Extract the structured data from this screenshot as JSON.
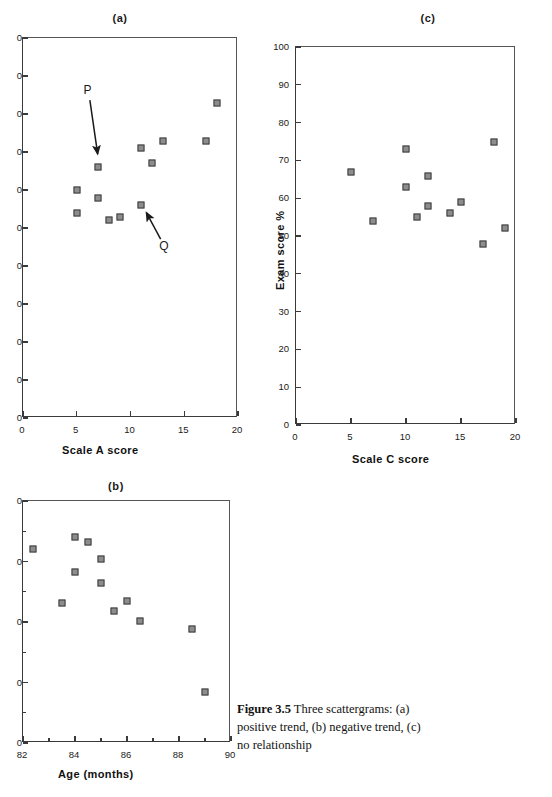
{
  "figure": {
    "caption_lead": "Figure 3.5",
    "caption_body": "Three scattergrams: (a) positive trend, (b) negative trend, (c) no relationship"
  },
  "chart_data": [
    {
      "id": "a",
      "type": "scatter",
      "title": "(a)",
      "xlabel": "Scale  A  score",
      "ylabel": "",
      "xlim": [
        0,
        20
      ],
      "ylim": [
        0,
        100
      ],
      "xticks": [
        0,
        5,
        10,
        15,
        20
      ],
      "xticklabels": [
        "0",
        "5",
        "10",
        "15",
        "20"
      ],
      "yticks": [
        0,
        10,
        20,
        30,
        40,
        50,
        60,
        70,
        80,
        90,
        100
      ],
      "yticklabels": [
        "0",
        "0",
        "0",
        "0",
        "0",
        "0",
        "0",
        "0",
        "0",
        "0",
        "0"
      ],
      "ytick_labels_clipped": true,
      "grid": false,
      "legend": "none",
      "points": [
        {
          "x": 5,
          "y": 60
        },
        {
          "x": 5,
          "y": 54
        },
        {
          "x": 7,
          "y": 66
        },
        {
          "x": 7,
          "y": 58
        },
        {
          "x": 8,
          "y": 52
        },
        {
          "x": 9,
          "y": 53
        },
        {
          "x": 11,
          "y": 56
        },
        {
          "x": 11,
          "y": 71
        },
        {
          "x": 12,
          "y": 67
        },
        {
          "x": 13,
          "y": 73
        },
        {
          "x": 17,
          "y": 73
        },
        {
          "x": 18,
          "y": 83
        }
      ],
      "annotations": [
        {
          "label": "P",
          "label_x": 6.1,
          "label_y": 86,
          "tip_x": 7.0,
          "tip_y": 68.4
        },
        {
          "label": "Q",
          "label_x": 13.2,
          "label_y": 45,
          "tip_x": 11.3,
          "tip_y": 55.0
        }
      ]
    },
    {
      "id": "b",
      "type": "scatter",
      "title": "(b)",
      "xlabel": "Age   (months)",
      "ylabel": "",
      "xlim": [
        82,
        90
      ],
      "ylim": [
        40,
        80
      ],
      "xticks": [
        82,
        84,
        86,
        88,
        90
      ],
      "xticklabels": [
        "82",
        "84",
        "86",
        "88",
        "90"
      ],
      "yticks": [
        40,
        45,
        50,
        55,
        60,
        65,
        70,
        75,
        80
      ],
      "yticklabels": [
        "0",
        "",
        "0",
        "",
        "0",
        "",
        "0",
        "",
        "0"
      ],
      "ytick_labels_clipped": true,
      "grid": false,
      "legend": "none",
      "points": [
        {
          "x": 82.4,
          "y": 72.0
        },
        {
          "x": 83.5,
          "y": 63.2
        },
        {
          "x": 84.0,
          "y": 74.0
        },
        {
          "x": 84.0,
          "y": 68.2
        },
        {
          "x": 84.5,
          "y": 73.2
        },
        {
          "x": 85.0,
          "y": 70.4
        },
        {
          "x": 85.0,
          "y": 66.4
        },
        {
          "x": 85.5,
          "y": 61.8
        },
        {
          "x": 86.0,
          "y": 63.4
        },
        {
          "x": 86.5,
          "y": 60.2
        },
        {
          "x": 88.5,
          "y": 58.8
        },
        {
          "x": 89.0,
          "y": 48.4
        }
      ],
      "annotations": []
    },
    {
      "id": "c",
      "type": "scatter",
      "title": "(c)",
      "xlabel": "Scale C score",
      "ylabel": "Exam score %",
      "xlim": [
        0,
        20
      ],
      "ylim": [
        0,
        100
      ],
      "xticks": [
        0,
        5,
        10,
        15,
        20
      ],
      "xticklabels": [
        "0",
        "5",
        "10",
        "15",
        "20"
      ],
      "yticks": [
        0,
        10,
        20,
        30,
        40,
        50,
        60,
        70,
        80,
        90,
        100
      ],
      "yticklabels": [
        "0",
        "10",
        "20",
        "30",
        "40",
        "50",
        "60",
        "70",
        "80",
        "90",
        "100"
      ],
      "ytick_labels_clipped": false,
      "grid": false,
      "legend": "none",
      "points": [
        {
          "x": 5,
          "y": 67
        },
        {
          "x": 7,
          "y": 54
        },
        {
          "x": 10,
          "y": 73
        },
        {
          "x": 10,
          "y": 63
        },
        {
          "x": 11,
          "y": 55
        },
        {
          "x": 12,
          "y": 66
        },
        {
          "x": 12,
          "y": 58
        },
        {
          "x": 14,
          "y": 56
        },
        {
          "x": 15,
          "y": 59
        },
        {
          "x": 17,
          "y": 48
        },
        {
          "x": 18,
          "y": 75
        },
        {
          "x": 19,
          "y": 52
        }
      ],
      "annotations": []
    }
  ],
  "colors": {
    "marker_fill": "#8d8d8d",
    "marker_edge": "#3d3d3d",
    "axis": "#3a3a3a",
    "text": "#1a1a1a",
    "background": "#ffffff"
  }
}
